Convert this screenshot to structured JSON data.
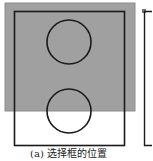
{
  "figure": {
    "caption": "(a) 选择框的位置",
    "colors": {
      "selection_fill": "#a0a0a0",
      "selection_border": "#8c8c8c",
      "frame_stroke": "#1a1a1a",
      "background": "#ffffff"
    },
    "selection_box": {
      "x": 5,
      "y": 3,
      "width": 130,
      "height": 108
    },
    "frame": {
      "x": 14,
      "y": 11,
      "width": 110,
      "height": 134
    },
    "circles": [
      {
        "label": "top-circle",
        "cx": 69,
        "cy": 42,
        "r": 22
      },
      {
        "label": "bottom-circle",
        "cx": 69,
        "cy": 111,
        "r": 22
      }
    ],
    "side_frame": {
      "x": 144,
      "y": 11,
      "height": 134
    }
  }
}
